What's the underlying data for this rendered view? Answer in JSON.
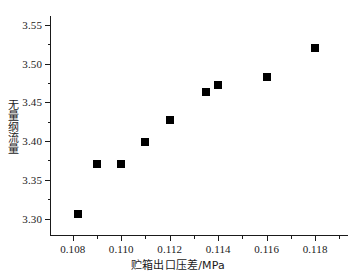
{
  "chart_data": {
    "type": "scatter",
    "title": "",
    "xlabel": "贮箱出口压差/MPa",
    "ylabel": "无量纲流量",
    "xlim": [
      0.1071,
      0.1194
    ],
    "ylim": [
      3.2775,
      3.5615
    ],
    "grid": false,
    "legend": null,
    "marker": "filled-square",
    "marker_color": "#000000",
    "xticks": [
      0.108,
      0.11,
      0.112,
      0.114,
      0.116,
      0.118
    ],
    "xtick_labels": [
      "0.108",
      "0.110",
      "0.112",
      "0.114",
      "0.116",
      "0.118"
    ],
    "xticks_minor": [
      0.109,
      0.111,
      0.113,
      0.115,
      0.117,
      0.119
    ],
    "yticks": [
      3.3,
      3.35,
      3.4,
      3.45,
      3.5,
      3.55
    ],
    "ytick_labels": [
      "3.30",
      "3.35",
      "3.40",
      "3.45",
      "3.50",
      "3.55"
    ],
    "yticks_minor": [
      3.325,
      3.375,
      3.425,
      3.475,
      3.525
    ],
    "x": [
      0.1082,
      0.109,
      0.11,
      0.111,
      0.112,
      0.1135,
      0.114,
      0.116,
      0.118
    ],
    "y": [
      3.306,
      3.371,
      3.371,
      3.399,
      3.427,
      3.464,
      3.473,
      3.483,
      3.52
    ],
    "points": [
      {
        "x": 0.1082,
        "y": 3.306
      },
      {
        "x": 0.109,
        "y": 3.371
      },
      {
        "x": 0.11,
        "y": 3.371
      },
      {
        "x": 0.111,
        "y": 3.399
      },
      {
        "x": 0.112,
        "y": 3.427
      },
      {
        "x": 0.1135,
        "y": 3.464
      },
      {
        "x": 0.114,
        "y": 3.473
      },
      {
        "x": 0.116,
        "y": 3.483
      },
      {
        "x": 0.118,
        "y": 3.52
      }
    ]
  }
}
